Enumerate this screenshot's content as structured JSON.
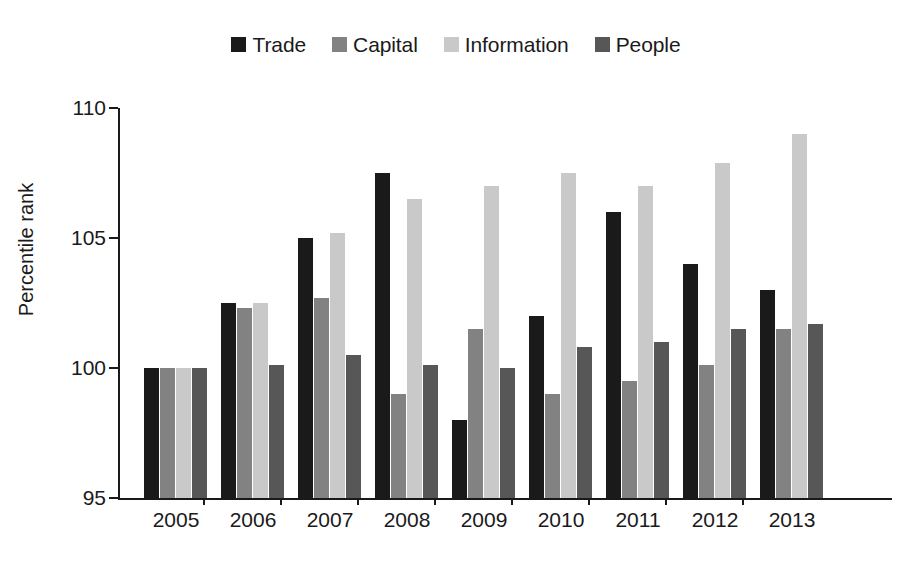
{
  "chart_data": {
    "type": "bar",
    "title": "",
    "subtitle": "",
    "xlabel": "",
    "ylabel": "Percentile rank",
    "categories": [
      "2005",
      "2006",
      "2007",
      "2008",
      "2009",
      "2010",
      "2011",
      "2012",
      "2013"
    ],
    "ylim": [
      95,
      110
    ],
    "yticks": [
      95,
      100,
      105,
      110
    ],
    "ytick_labels": [
      "95",
      "100",
      "105",
      "110"
    ],
    "grid": false,
    "legend_position": "top-center",
    "series": [
      {
        "name": "Trade",
        "color": "#1a1a1a",
        "values": [
          100.0,
          102.5,
          105.0,
          107.5,
          98.0,
          102.0,
          106.0,
          104.0,
          103.0
        ]
      },
      {
        "name": "Capital",
        "color": "#828282",
        "values": [
          100.0,
          102.3,
          102.7,
          99.0,
          101.5,
          99.0,
          99.5,
          100.1,
          101.5
        ]
      },
      {
        "name": "Information",
        "color": "#c9c9c9",
        "values": [
          100.0,
          102.5,
          105.2,
          106.5,
          107.0,
          107.5,
          107.0,
          107.9,
          109.0
        ]
      },
      {
        "name": "People",
        "color": "#575757",
        "values": [
          100.0,
          100.1,
          100.5,
          100.1,
          100.0,
          100.8,
          101.0,
          101.5,
          101.7
        ]
      }
    ]
  },
  "legend": {
    "items": [
      {
        "label": "Trade",
        "color": "#1a1a1a"
      },
      {
        "label": "Capital",
        "color": "#828282"
      },
      {
        "label": "Information",
        "color": "#c9c9c9"
      },
      {
        "label": "People",
        "color": "#575757"
      }
    ]
  },
  "axes": {
    "y_title": "Percentile rank",
    "y_tick_labels": [
      "110",
      "105",
      "100",
      "95"
    ],
    "x_tick_labels": [
      "2005",
      "2006",
      "2007",
      "2008",
      "2009",
      "2010",
      "2011",
      "2012",
      "2013"
    ]
  },
  "colors": {
    "axis": "#1a1a1a",
    "background": "#ffffff",
    "trade": "#1a1a1a",
    "capital": "#828282",
    "information": "#c9c9c9",
    "people": "#575757"
  }
}
